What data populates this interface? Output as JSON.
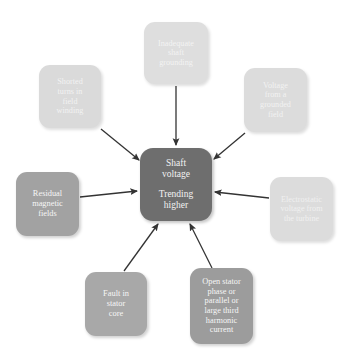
{
  "diagram": {
    "type": "radial-cause-diagram",
    "title": "",
    "background_color": "#ffffff",
    "arrow_color": "#333333",
    "arrow_direction": "inward-to-center",
    "center": {
      "id": "center",
      "line1": "Shaft\nvoltage",
      "line2": "Trending\nhigher",
      "fill_color": "#6e6e6e",
      "text_color": "#f2f2f2"
    },
    "nodes": [
      {
        "id": "top",
        "label": "Inadequate\nshaft\ngrounding",
        "position": "top",
        "fill_color": "#dedede",
        "text_color": "#f3f3f3"
      },
      {
        "id": "top-left",
        "label": "Shorted\nturns in\nfield\nwinding",
        "position": "top-left",
        "fill_color": "#dadada",
        "text_color": "#f2f2f2"
      },
      {
        "id": "top-right",
        "label": "Voltage\nfrom a\ngrounded\nfield",
        "position": "top-right",
        "fill_color": "#dcdcdc",
        "text_color": "#f2f2f2"
      },
      {
        "id": "left",
        "label": "Residual\nmagnetic\nfields",
        "position": "left",
        "fill_color": "#a2a2a2",
        "text_color": "#f6f6f6"
      },
      {
        "id": "right",
        "label": "Electrostatic\nvoltage from\nthe turbine",
        "position": "right",
        "fill_color": "#dcdcdc",
        "text_color": "#f0f0f0"
      },
      {
        "id": "bottom-left",
        "label": "Fault in\nstator\ncore",
        "position": "bottom-left",
        "fill_color": "#a8a8a8",
        "text_color": "#f6f6f6"
      },
      {
        "id": "bottom-right",
        "label": "Open stator\nphase or\nparallel or\nlarge third\nharmonic\ncurrent",
        "position": "bottom-right",
        "fill_color": "#9c9c9c",
        "text_color": "#f6f6f6"
      }
    ]
  }
}
